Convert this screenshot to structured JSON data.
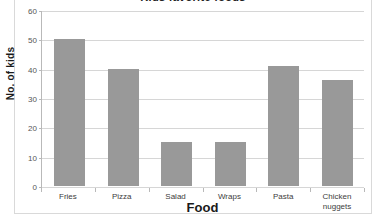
{
  "chart_data": {
    "type": "bar",
    "title": "Kids favorite foods",
    "xlabel": "Food",
    "ylabel": "No. of kids",
    "categories": [
      "Fries",
      "Pizza",
      "Salad",
      "Wraps",
      "Pasta",
      "Chicken nuggets"
    ],
    "values": [
      50,
      40,
      15,
      15,
      41,
      36
    ],
    "ylim": [
      0,
      60
    ],
    "ytick_labels": [
      "0",
      "10",
      "20",
      "30",
      "40",
      "50",
      "60"
    ],
    "ytick_values": [
      0,
      10,
      20,
      30,
      40,
      50,
      60
    ],
    "grid": true,
    "legend": "none",
    "bar_color": "#999999",
    "gridline_color": "#d6d6d6",
    "axis_color": "#b9b9b9",
    "plot_background": "#ffffff"
  }
}
